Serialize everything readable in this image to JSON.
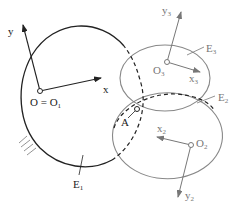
{
  "diagram": {
    "type": "coordinate-frames-ellipses",
    "colors": {
      "primary": "#222222",
      "secondary": "#808080",
      "background": "#ffffff"
    },
    "frames": [
      {
        "id": "O1",
        "origin_label": "O = O",
        "origin_sub": "1",
        "x_label": "x",
        "y_label": "y",
        "x_sub": "",
        "y_sub": ""
      },
      {
        "id": "O3",
        "origin_label": "O",
        "origin_sub": "3",
        "x_label": "x",
        "x_sub": "3",
        "y_label": "y",
        "y_sub": "3"
      },
      {
        "id": "O2",
        "origin_label": "O",
        "origin_sub": "2",
        "x_label": "x",
        "x_sub": "2",
        "y_label": "y",
        "y_sub": "2"
      }
    ],
    "bodies": [
      {
        "id": "E1",
        "label": "E",
        "sub": "1",
        "note": "fixed body (hatched ground)"
      },
      {
        "id": "E2",
        "label": "E",
        "sub": "2"
      },
      {
        "id": "E3",
        "label": "E",
        "sub": "3"
      }
    ],
    "points": [
      {
        "id": "A",
        "label": "A"
      }
    ]
  }
}
